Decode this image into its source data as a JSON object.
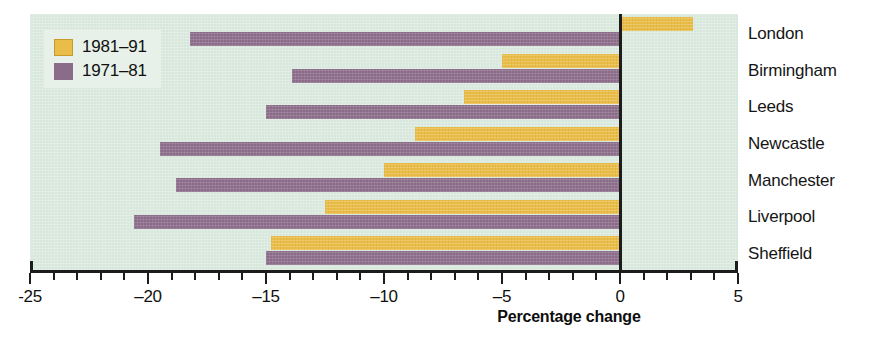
{
  "chart_data": {
    "type": "bar",
    "orientation": "horizontal",
    "title": "",
    "subtitle": "",
    "xlabel": "Percentage change",
    "ylabel": "",
    "xlim": [
      -25,
      5
    ],
    "xticks": [
      -25,
      -20,
      -15,
      -10,
      -5,
      0,
      5
    ],
    "xtick_labels": [
      "-25",
      "–20",
      "–15",
      "–10",
      "–5",
      "0",
      "5"
    ],
    "minor_tick_step": 1,
    "grid": false,
    "legend_position": "top-left",
    "categories": [
      "London",
      "Birmingham",
      "Leeds",
      "Newcastle",
      "Manchester",
      "Liverpool",
      "Sheffield"
    ],
    "series": [
      {
        "name": "1981–91",
        "color": "#e9bd48",
        "values": [
          3.1,
          -5.0,
          -6.6,
          -8.7,
          -10.0,
          -12.5,
          -14.8
        ]
      },
      {
        "name": "1971–81",
        "color": "#8a6b88",
        "values": [
          -18.2,
          -13.9,
          -15.0,
          -19.5,
          -18.8,
          -20.6,
          -15.0
        ]
      }
    ],
    "annotations": []
  },
  "legend": {
    "items": [
      {
        "label": "1981–91",
        "swatch": "legend-swatch-1981"
      },
      {
        "label": "1971–81",
        "swatch": "legend-swatch-1971"
      }
    ]
  },
  "axis": {
    "title": "Percentage change",
    "tick_labels": [
      "-25",
      "–20",
      "–15",
      "–10",
      "–5",
      "0",
      "5"
    ]
  },
  "colors": {
    "background": "#d7e7dc",
    "legend_background": "#e7f0e9",
    "series_1981": "#e9bd48",
    "series_1971": "#8a6b88",
    "axis": "#1c1c1c",
    "text": "#101010"
  }
}
